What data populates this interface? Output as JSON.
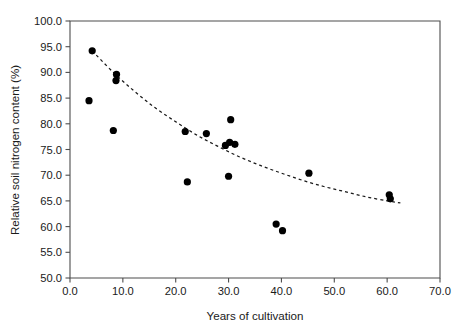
{
  "chart_data": {
    "type": "scatter",
    "title": "",
    "xlabel": "Years of cultivation",
    "ylabel": "Relative soil nitrogen content (%)",
    "xlim": [
      0.0,
      70.0
    ],
    "ylim": [
      50.0,
      100.0
    ],
    "xticks": [
      "0.0",
      "10.0",
      "20.0",
      "30.0",
      "40.0",
      "50.0",
      "60.0",
      "70.0"
    ],
    "xtick_values": [
      0.0,
      10.0,
      20.0,
      30.0,
      40.0,
      50.0,
      60.0,
      70.0
    ],
    "yticks": [
      "50.0",
      "55.0",
      "60.0",
      "65.0",
      "70.0",
      "75.0",
      "80.0",
      "85.0",
      "90.0",
      "95.0",
      "100.0"
    ],
    "ytick_values": [
      50.0,
      55.0,
      60.0,
      65.0,
      70.0,
      75.0,
      80.0,
      85.0,
      90.0,
      95.0,
      100.0
    ],
    "grid": false,
    "legend": false,
    "legend_position": "none",
    "marker": "filled-circle",
    "marker_color": "#000000",
    "series": [
      {
        "name": "Relative soil nitrogen content",
        "points": [
          {
            "x": 4.2,
            "y": 94.2
          },
          {
            "x": 3.6,
            "y": 84.5
          },
          {
            "x": 8.8,
            "y": 89.6
          },
          {
            "x": 8.7,
            "y": 88.4
          },
          {
            "x": 8.2,
            "y": 78.7
          },
          {
            "x": 22.2,
            "y": 68.7
          },
          {
            "x": 21.8,
            "y": 78.5
          },
          {
            "x": 25.8,
            "y": 78.1
          },
          {
            "x": 30.4,
            "y": 80.8
          },
          {
            "x": 30.0,
            "y": 69.8
          },
          {
            "x": 29.4,
            "y": 75.8
          },
          {
            "x": 30.2,
            "y": 76.4
          },
          {
            "x": 31.2,
            "y": 76.0
          },
          {
            "x": 39.0,
            "y": 60.5
          },
          {
            "x": 40.2,
            "y": 59.2
          },
          {
            "x": 45.2,
            "y": 70.4
          },
          {
            "x": 60.4,
            "y": 66.2
          },
          {
            "x": 60.6,
            "y": 65.4
          }
        ]
      }
    ],
    "trend_curve": {
      "style": "dashed",
      "color": "#1a1a1a",
      "description": "exponential decay fit",
      "x_start": 4.2,
      "x_end": 62.5,
      "points": [
        {
          "x": 4.2,
          "y": 94.2
        },
        {
          "x": 8.0,
          "y": 90.2
        },
        {
          "x": 12.0,
          "y": 86.5
        },
        {
          "x": 16.0,
          "y": 83.2
        },
        {
          "x": 20.0,
          "y": 80.4
        },
        {
          "x": 24.0,
          "y": 77.8
        },
        {
          "x": 28.0,
          "y": 75.6
        },
        {
          "x": 32.0,
          "y": 73.6
        },
        {
          "x": 36.0,
          "y": 71.9
        },
        {
          "x": 40.0,
          "y": 70.4
        },
        {
          "x": 44.0,
          "y": 69.0
        },
        {
          "x": 48.0,
          "y": 67.8
        },
        {
          "x": 52.0,
          "y": 66.8
        },
        {
          "x": 56.0,
          "y": 65.8
        },
        {
          "x": 60.0,
          "y": 65.0
        },
        {
          "x": 62.5,
          "y": 64.6
        }
      ]
    }
  }
}
